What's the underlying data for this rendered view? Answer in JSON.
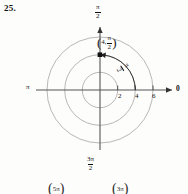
{
  "exercise": {
    "number": "25."
  },
  "figure": {
    "type": "polar-grid-plot",
    "center": {
      "x": 100,
      "y": 90
    },
    "pixels_per_unit": 8.83,
    "circles": [
      {
        "r": 2,
        "radius_px": 17.7
      },
      {
        "r": 4,
        "radius_px": 35.3
      },
      {
        "r": 6,
        "radius_px": 53.0
      }
    ],
    "axes": {
      "right_label": "0",
      "left_label": "π",
      "top_label": {
        "numerator": "π",
        "denominator": "2"
      },
      "bottom_label": {
        "numerator": "3π",
        "denominator": "2"
      }
    },
    "radial_ticks": [
      {
        "label": "2",
        "value": 2
      },
      {
        "label": "4",
        "value": 4
      },
      {
        "label": "6",
        "value": 6
      }
    ],
    "plotted_point": {
      "r": 4,
      "theta": {
        "numerator": "π",
        "denominator": "2"
      },
      "label_open": "(",
      "label_r": "4,",
      "label_close": ")",
      "x_px": 100,
      "y_px": 54.7
    },
    "angle_arc": {
      "label": {
        "numerator": "π",
        "denominator": "2"
      },
      "from_deg": 0,
      "to_deg": 90,
      "direction": "counterclockwise",
      "arrow": "arrowhead-at-end"
    },
    "colors": {
      "grid": "#9a9a9a",
      "axis": "#4a4a4a",
      "ink": "#111111",
      "background": "#fdfdfc"
    }
  },
  "bottom_fragment": {
    "item_1": {
      "open": "(",
      "text": "5π",
      "close": ")"
    },
    "item_2": {
      "open": "(",
      "text": "3π",
      "close": ")"
    }
  }
}
